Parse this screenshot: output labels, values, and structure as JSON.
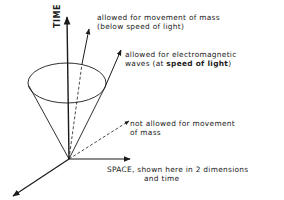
{
  "diagram": {
    "type": "light-cone",
    "axes": {
      "time": {
        "label": "TIME"
      },
      "space": {
        "label": "SPACE, shown here in 2 dimensions",
        "label_line2": "and time"
      }
    },
    "annotations": {
      "mass_allowed": {
        "line1": "allowed for movement of mass",
        "line2": "(below speed of light)"
      },
      "em_waves": {
        "line1": "allowed for electromagnetic",
        "line2_prefix": "waves (at ",
        "line2_bold": "speed of light",
        "line2_suffix": ")"
      },
      "not_allowed": {
        "line1": "not allowed for movement",
        "line2": "of mass"
      }
    },
    "colors": {
      "ink": "#1a1a1a",
      "background": "#ffffff"
    }
  }
}
